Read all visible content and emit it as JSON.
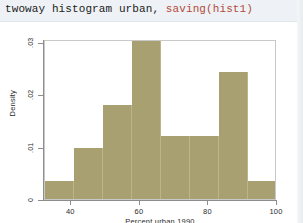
{
  "command": {
    "full": "twoway histogram urban, saving(hist1)",
    "main": "twoway histogram urban, ",
    "option": "saving(hist1)",
    "option_color": "#b24a3a"
  },
  "chart_data": {
    "type": "bar",
    "title": "",
    "subtitle": "",
    "xlabel": "Percent urban 1990",
    "ylabel": "Density",
    "xlim": [
      32.3,
      100
    ],
    "ylim": [
      0,
      0.0305
    ],
    "xticks": [
      40,
      60,
      80,
      100
    ],
    "xtick_labels": [
      "40",
      "60",
      "80",
      "100"
    ],
    "yticks": [
      0,
      0.01,
      0.02,
      0.03
    ],
    "ytick_labels": [
      "0",
      ".01",
      ".02",
      ".03"
    ],
    "grid": false,
    "legend": "none",
    "bar_color": "#a8a070",
    "bin_edges": [
      32.3,
      40.75,
      49.2,
      57.6,
      66.05,
      74.5,
      82.95,
      91.4,
      99.85
    ],
    "categories": [
      "32.3-40.8",
      "40.8-49.2",
      "49.2-57.6",
      "57.6-66.1",
      "66.1-74.5",
      "74.5-83.0",
      "83.0-91.4",
      "91.4-99.9"
    ],
    "values": [
      0.0035,
      0.0098,
      0.018,
      0.0305,
      0.012,
      0.012,
      0.0243,
      0.0035
    ],
    "n_bins": 8
  }
}
